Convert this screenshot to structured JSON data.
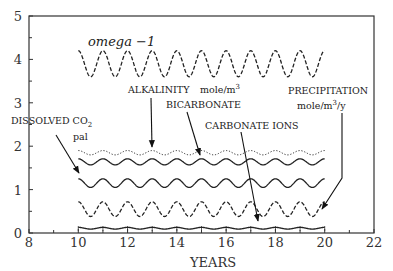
{
  "chart_data": {
    "type": "line",
    "title": "",
    "xlabel": "YEARS",
    "ylabel": "",
    "xlim": [
      8,
      22
    ],
    "ylim": [
      0,
      5
    ],
    "grid": false,
    "x_ticks": [
      "8",
      "10",
      "12",
      "14",
      "16",
      "18",
      "20",
      "22"
    ],
    "y_ticks": [
      "0",
      "1",
      "2",
      "3",
      "4",
      "5"
    ],
    "x_range_of_series": [
      10,
      20
    ],
    "period_years": 1,
    "series": [
      {
        "name": "omega -1",
        "style": "dashed",
        "mean": 3.9,
        "amplitude": 0.3,
        "start": 4.0
      },
      {
        "name": "ALKALINITY mole/m3",
        "style": "dotted",
        "mean": 1.85,
        "amplitude": 0.05,
        "start": 1.93
      },
      {
        "name": "BICARBONATE",
        "style": "solid",
        "mean": 1.64,
        "amplitude": 0.07,
        "start": 1.68
      },
      {
        "name": "DISSOLVED CO2 pal",
        "style": "solid",
        "mean": 1.15,
        "amplitude": 0.1,
        "start": 1.27
      },
      {
        "name": "CARBONATE IONS",
        "style": "dashed",
        "mean": 0.55,
        "amplitude": 0.17,
        "start": 0.58
      },
      {
        "name": "PRECIPITATION mole/m3/y",
        "style": "solid",
        "mean": 0.11,
        "amplitude": 0.02,
        "start": 0.1
      }
    ],
    "annotations": [
      {
        "text": "omega -1"
      },
      {
        "text": "DISSOLVED CO2"
      },
      {
        "text": "pal"
      },
      {
        "text": "ALKALINITY"
      },
      {
        "text": "mole/m3"
      },
      {
        "text": "BICARBONATE"
      },
      {
        "text": "CARBONATE IONS"
      },
      {
        "text": "PRECIPITATION"
      },
      {
        "text": "mole/m3/y"
      }
    ]
  },
  "labels": {
    "omega": "omega −1",
    "dissolved": "DISSOLVED CO",
    "dissolved_sub": "2",
    "pal": "pal",
    "alkalinity": "ALKALINITY",
    "alk_unit": "mole/m",
    "alk_unit_sup": "3",
    "bicarbonate": "BICARBONATE",
    "carbonate": "CARBONATE IONS",
    "precip": "PRECIPITATION",
    "precip_unit_a": "mole/m",
    "precip_unit_sup": "3",
    "precip_unit_b": "/y",
    "xlabel": "YEARS"
  }
}
